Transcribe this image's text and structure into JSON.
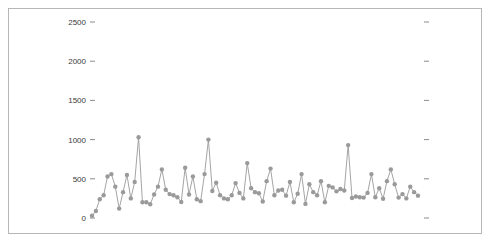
{
  "chart_data": {
    "type": "scatter",
    "title": "",
    "subtitle": "",
    "xlabel": "",
    "ylabel": "",
    "legend": [],
    "grid": false,
    "marker": "circle",
    "line_connected": true,
    "series_color": "#9a9a9a",
    "marker_color": "#9a9a9a",
    "ylim": [
      0,
      2700
    ],
    "yticks": [
      0,
      500,
      1000,
      1500,
      2000,
      2500
    ],
    "ytick_labels": [
      "0",
      "500",
      "1000",
      "1500",
      "2000",
      "2500"
    ],
    "xticks": [],
    "xtick_labels": [],
    "right_axis_ticks": true,
    "x": [
      1,
      2,
      3,
      4,
      5,
      6,
      7,
      8,
      9,
      10,
      11,
      12,
      13,
      14,
      15,
      16,
      17,
      18,
      19,
      20,
      21,
      22,
      23,
      24,
      25,
      26,
      27,
      28,
      29,
      30,
      31,
      32,
      33,
      34,
      35,
      36,
      37,
      38,
      39,
      40,
      41,
      42,
      43,
      44,
      45,
      46,
      47,
      48,
      49,
      50,
      51,
      52,
      53,
      54,
      55,
      56,
      57,
      58,
      59,
      60,
      61,
      62,
      63,
      64,
      65,
      66,
      67,
      68,
      69,
      70,
      71,
      72,
      73,
      74,
      75,
      76,
      77,
      78,
      79,
      80,
      81,
      82,
      83,
      84,
      85
    ],
    "values": [
      30,
      90,
      240,
      290,
      530,
      560,
      400,
      120,
      330,
      550,
      250,
      460,
      1030,
      200,
      200,
      175,
      300,
      400,
      620,
      360,
      305,
      290,
      265,
      205,
      640,
      300,
      530,
      240,
      215,
      560,
      1000,
      345,
      450,
      290,
      250,
      240,
      290,
      445,
      320,
      250,
      700,
      380,
      330,
      315,
      210,
      470,
      630,
      290,
      350,
      360,
      285,
      460,
      200,
      310,
      560,
      180,
      430,
      330,
      290,
      470,
      200,
      410,
      390,
      340,
      370,
      350,
      930,
      255,
      275,
      265,
      260,
      320,
      560,
      265,
      380,
      245,
      470,
      620,
      430,
      260,
      305,
      250,
      400,
      330,
      285
    ]
  },
  "axis": {
    "y_tick_mark_glyph": "–",
    "left_tick_x": 90,
    "right_tick_x": 424
  }
}
